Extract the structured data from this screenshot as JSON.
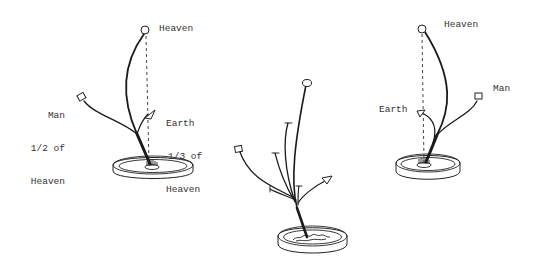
{
  "diagram": {
    "figures": [
      {
        "id": "left",
        "labels": {
          "heaven": "Heaven",
          "man": [
            "Man",
            "1/2 of",
            "Heaven"
          ],
          "earth": [
            "Earth",
            "1/3 of",
            "Heaven"
          ]
        }
      },
      {
        "id": "middle",
        "labels": {}
      },
      {
        "id": "right",
        "labels": {
          "heaven": "Heaven",
          "man": "Man",
          "earth": "Earth"
        }
      }
    ],
    "colors": {
      "background": "#ffffff",
      "ink": "#1a1a1a",
      "text": "#333333"
    }
  }
}
